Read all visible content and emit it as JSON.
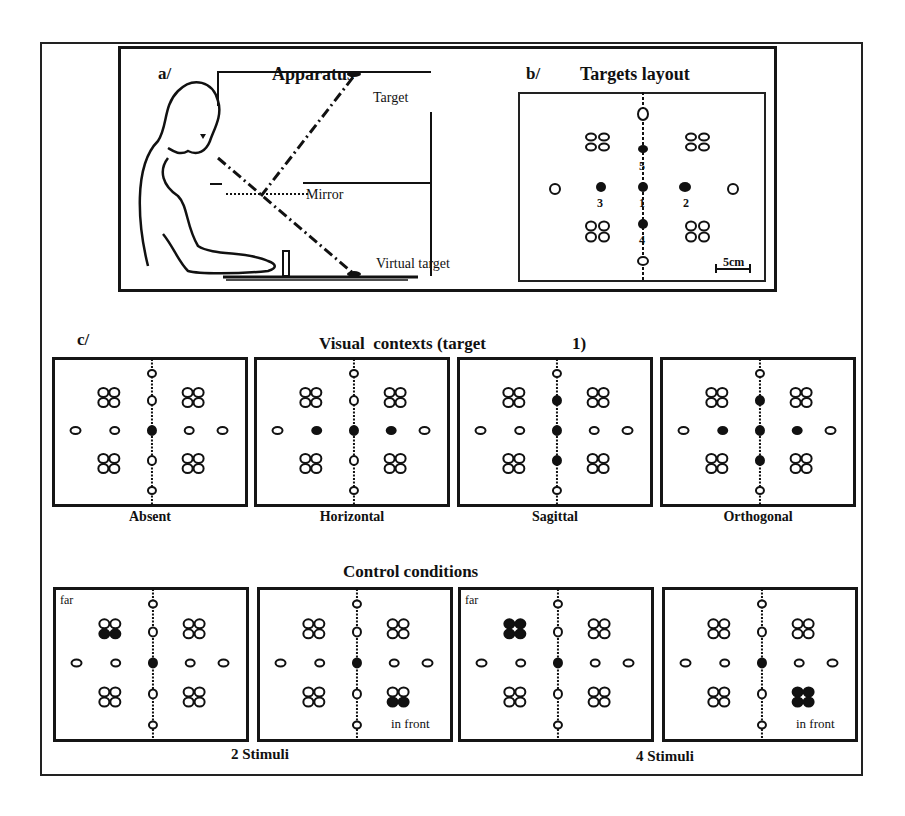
{
  "figure": {
    "panel_a": {
      "tag": "a/",
      "title": "Apparatus",
      "labels": {
        "target": "Target",
        "mirror": "Mirror",
        "virtual_target": "Virtual target"
      }
    },
    "panel_b": {
      "tag": "b/",
      "title": "Targets layout",
      "target_numbers": [
        "5",
        "3",
        "1",
        "2",
        "4"
      ],
      "scale_bar": "5cm"
    },
    "panel_c": {
      "tag": "c/",
      "visual_contexts_title": "Visual  contexts (target",
      "visual_contexts_target": "1)",
      "contexts": [
        {
          "label": "Absent",
          "filled": [
            "center"
          ]
        },
        {
          "label": "Horizontal",
          "filled": [
            "center",
            "left",
            "right"
          ]
        },
        {
          "label": "Sagittal",
          "filled": [
            "center",
            "up",
            "down"
          ]
        },
        {
          "label": "Orthogonal",
          "filled": [
            "center",
            "left",
            "right",
            "up",
            "down"
          ]
        }
      ],
      "control_title": "Control conditions",
      "controls": [
        {
          "note": "far",
          "filled_cluster": "top-left",
          "count": "2"
        },
        {
          "note": "in front",
          "filled_cluster": "bottom-right",
          "count": "2"
        },
        {
          "note": "far",
          "filled_cluster": "top-left",
          "count": "4"
        },
        {
          "note": "in front",
          "filled_cluster": "bottom-right",
          "count": "4"
        }
      ],
      "control_group_labels": [
        "2 Stimuli",
        "4 Stimuli"
      ]
    }
  }
}
